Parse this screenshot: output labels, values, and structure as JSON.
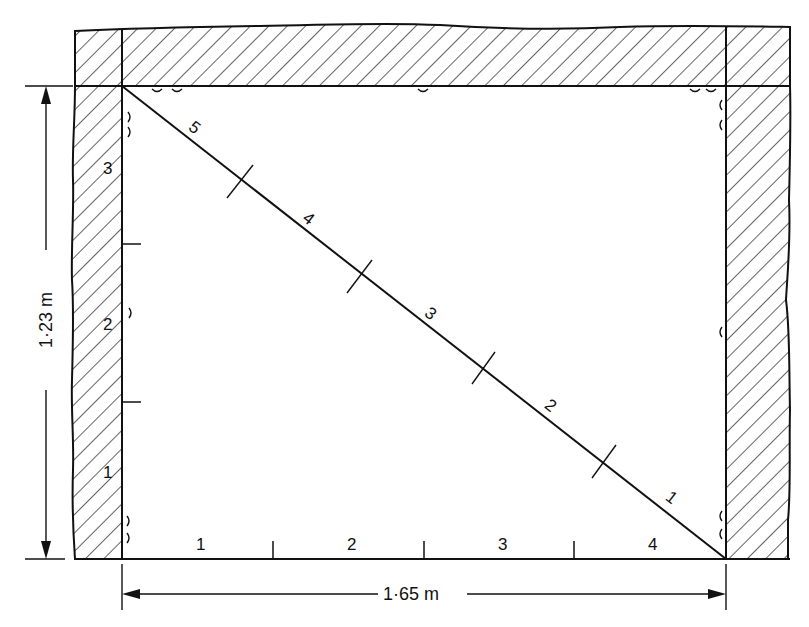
{
  "diagram": {
    "type": "room-floor-plan-3-4-5-check",
    "colors": {
      "line": "#111111",
      "background": "#ffffff",
      "hatch": "#111111"
    },
    "dimensions": {
      "width_label": "1·65 m",
      "height_label": "1·23 m"
    },
    "bottom_scale": {
      "labels": [
        "1",
        "2",
        "3",
        "4"
      ]
    },
    "left_scale": {
      "labels": [
        "1",
        "2",
        "3"
      ]
    },
    "diagonal_scale": {
      "labels": [
        "1",
        "2",
        "3",
        "4",
        "5"
      ]
    }
  }
}
